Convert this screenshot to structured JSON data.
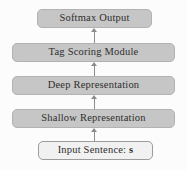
{
  "diagram": {
    "flow_direction": "bottom-to-top",
    "nodes": [
      {
        "id": "softmax-output",
        "label": "Softmax Output",
        "style": "gray"
      },
      {
        "id": "tag-scoring-module",
        "label": "Tag Scoring Module",
        "style": "gray"
      },
      {
        "id": "deep-representation",
        "label": "Deep Representation",
        "style": "gray"
      },
      {
        "id": "shallow-representation",
        "label": "Shallow Representation",
        "style": "gray"
      },
      {
        "id": "input-sentence",
        "label": "Input Sentence: ",
        "label_bold": "s",
        "style": "light"
      }
    ],
    "edges": [
      {
        "from": "input-sentence",
        "to": "shallow-representation"
      },
      {
        "from": "shallow-representation",
        "to": "deep-representation"
      },
      {
        "from": "deep-representation",
        "to": "tag-scoring-module"
      },
      {
        "from": "tag-scoring-module",
        "to": "softmax-output"
      }
    ],
    "colors": {
      "background": "#fcfcfc",
      "node_fill": "#c6c6c6",
      "node_border": "#b2b2b2",
      "input_fill": "#f1f1f1",
      "input_border": "#9c9c9c",
      "arrow": "#8c8c8c",
      "text": "#2e2e2e"
    }
  }
}
